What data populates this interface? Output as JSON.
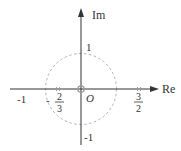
{
  "diagram": {
    "type": "complex-plane pole-zero plot",
    "axes": {
      "real_label": "Re",
      "imag_label": "Im",
      "origin_label": "O"
    },
    "unit_circle": {
      "radius": 1,
      "style": "dashed"
    },
    "tick_labels": {
      "real_neg_one": "-1",
      "imag_pos_one": "1",
      "imag_neg_one": "-1"
    },
    "poles": [
      {
        "value": "-2/3",
        "num": "2",
        "den": "3",
        "sign": "-"
      },
      {
        "value": "3/2",
        "num": "3",
        "den": "2",
        "sign": ""
      }
    ],
    "zeros": [
      {
        "value": "0",
        "marker": "circle"
      }
    ],
    "colors": {
      "axis": "#333333",
      "circle": "#aaaaaa",
      "marker": "#999999",
      "zero_marker": "#999999"
    }
  }
}
